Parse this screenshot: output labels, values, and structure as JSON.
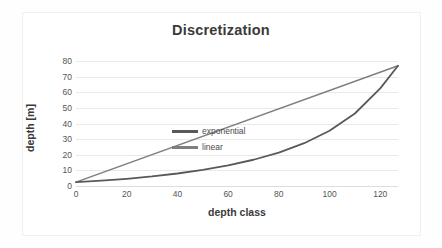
{
  "chart_data": {
    "type": "line",
    "title": "Discretization",
    "xlabel": "depth class",
    "ylabel": "depth [m]",
    "xlim": [
      0,
      127
    ],
    "ylim": [
      0,
      80
    ],
    "xticks": [
      0,
      20,
      40,
      60,
      80,
      100,
      120
    ],
    "yticks": [
      0,
      10,
      20,
      30,
      40,
      50,
      60,
      70,
      80
    ],
    "grid": "horizontal",
    "legend_position": "upper-left-inside",
    "series": [
      {
        "name": "exponential",
        "color": "#595959",
        "x": [
          0,
          10,
          20,
          30,
          40,
          50,
          60,
          70,
          80,
          90,
          100,
          110,
          120,
          127
        ],
        "values": [
          2.5,
          3.4,
          4.6,
          6.1,
          8.0,
          10.3,
          13.2,
          16.8,
          21.4,
          27.4,
          35.4,
          46.4,
          62.5,
          77.0
        ]
      },
      {
        "name": "linear",
        "color": "#7f7f7f",
        "x": [
          0,
          127
        ],
        "values": [
          2.5,
          77.0
        ]
      }
    ]
  },
  "colors": {
    "title": "#3a3a3a",
    "axis_text": "#555555",
    "gridline": "#e9e9e9",
    "exponential": "#595959",
    "linear": "#7f7f7f",
    "background": "#ffffff"
  }
}
